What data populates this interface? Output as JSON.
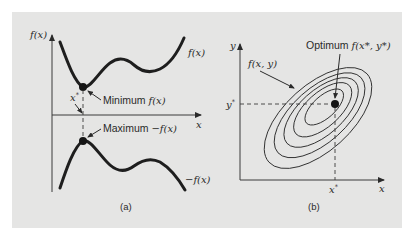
{
  "figure": {
    "background_color": "#e5e5e4",
    "panel_a": {
      "caption": "(a)",
      "y_axis_label": "f(x)",
      "x_axis_label": "x",
      "curve_top_label": "f(x)",
      "curve_bottom_label": "−f(x)",
      "optimum_x_label": "x",
      "optimum_x_superscript": "*",
      "minimum_annotation_prefix": "Minimum ",
      "minimum_annotation_math": "f(x)",
      "maximum_annotation_prefix": "Maximum ",
      "maximum_annotation_math": "−f(x)"
    },
    "panel_b": {
      "caption": "(b)",
      "y_axis_label": "y",
      "x_axis_label": "x",
      "surface_label": "f(x, y)",
      "optimum_annotation_prefix": "Optimum ",
      "optimum_annotation_math": "f(x*, y*)",
      "y_star_label": "y",
      "x_star_label": "x",
      "star_superscript": "*",
      "contour_count": 5
    }
  }
}
